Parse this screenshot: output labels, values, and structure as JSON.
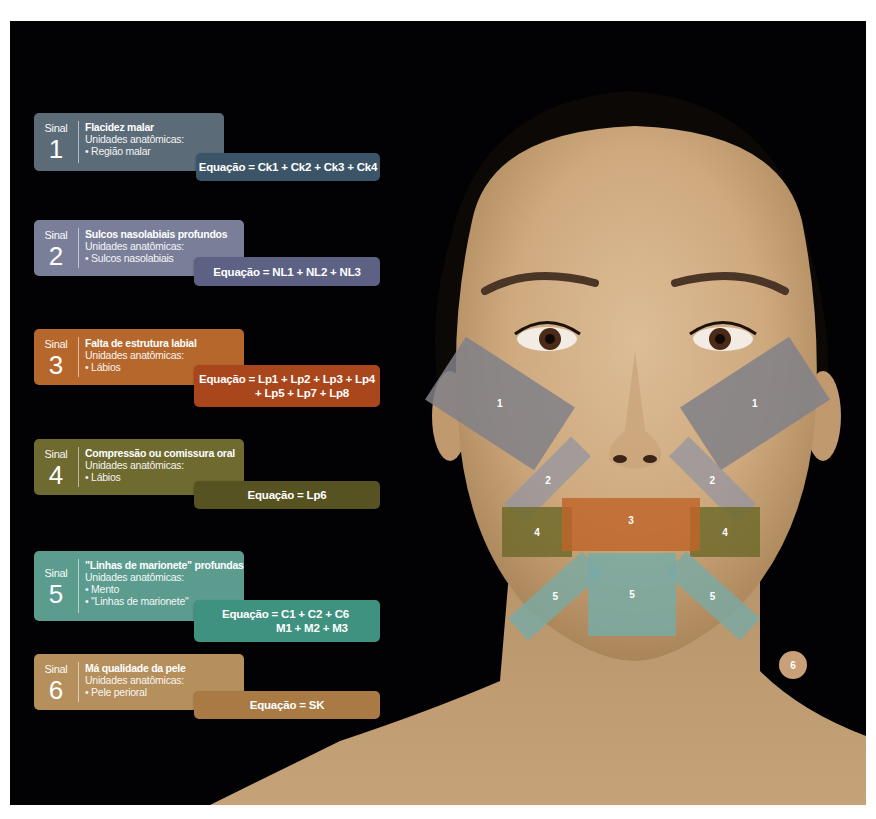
{
  "colors": {
    "background": "#020204",
    "signal1": "#5c6b78",
    "signal1_eq": "#3c5467",
    "signal2": "#7a7f99",
    "signal2_eq": "#5d6184",
    "signal3": "#b5672c",
    "signal3_eq": "#a9461b",
    "signal4": "#6e6a30",
    "signal4_eq": "#575221",
    "signal5": "#5b9c8f",
    "signal5_eq": "#3f927f",
    "signal6": "#b58f5c",
    "signal6_eq": "#a97a44"
  },
  "signals": [
    {
      "sinal_label": "Sinal",
      "number": "1",
      "title": "Flacidez malar",
      "units_label": "Unidades anatômicas:",
      "units": [
        "• Região malar"
      ],
      "equation": [
        "Equação = Ck1 + Ck2 + Ck3 + Ck4"
      ]
    },
    {
      "sinal_label": "Sinal",
      "number": "2",
      "title": "Sulcos nasolabiais profundos",
      "units_label": "Unidades anatômicas:",
      "units": [
        "• Sulcos nasolabiais"
      ],
      "equation": [
        "Equação = NL1 + NL2 + NL3"
      ]
    },
    {
      "sinal_label": "Sinal",
      "number": "3",
      "title": "Falta de estrutura labial",
      "units_label": "Unidades anatômicas:",
      "units": [
        "• Lábios"
      ],
      "equation": [
        "Equação = Lp1 + Lp2 + Lp3 + Lp4",
        "+ Lp5 + Lp7 + Lp8"
      ]
    },
    {
      "sinal_label": "Sinal",
      "number": "4",
      "title": "Compressão ou comissura oral",
      "units_label": "Unidades anatômicas:",
      "units": [
        "• Lábios"
      ],
      "equation": [
        "Equação = Lp6"
      ]
    },
    {
      "sinal_label": "Sinal",
      "number": "5",
      "title": "\"Linhas de marionete\" profundas",
      "units_label": "Unidades anatômicas:",
      "units": [
        "• Mento",
        "• \"Linhas de marionete\""
      ],
      "equation": [
        "Equação = C1 + C2 + C6",
        "M1 + M2 + M3"
      ]
    },
    {
      "sinal_label": "Sinal",
      "number": "6",
      "title": "Má qualidade da pele",
      "units_label": "Unidades anatômicas:",
      "units": [
        "• Pele perioral"
      ],
      "equation": [
        "Equação = SK"
      ]
    }
  ],
  "face_overlays": {
    "malar_left": "1",
    "malar_right": "1",
    "nasolabial_left": "2",
    "nasolabial_right": "2",
    "lips": "3",
    "commissure_left": "4",
    "commissure_right": "4",
    "marionette_left": "5",
    "chin": "5",
    "marionette_right": "5",
    "skin_badge": "6"
  }
}
